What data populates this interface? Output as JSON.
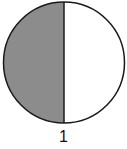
{
  "figure": {
    "label": "1",
    "fraction_shaded": "1/2",
    "shaded_side": "left",
    "colors": {
      "shaded": "#8c8c8c",
      "unshaded": "#ffffff",
      "outline": "#1a1a1a"
    }
  }
}
